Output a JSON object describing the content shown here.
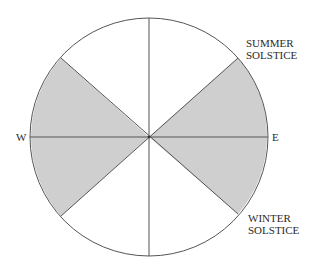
{
  "diagram": {
    "labels": {
      "west": "W",
      "east": "E",
      "summer_line1": "SUMMER",
      "summer_line2": "SOLSTICE",
      "winter_line1": "WINTER",
      "winter_line2": "SOLSTICE"
    },
    "colors": {
      "shaded": "#cfcfcf",
      "stroke": "#555555",
      "background": "#ffffff"
    }
  }
}
